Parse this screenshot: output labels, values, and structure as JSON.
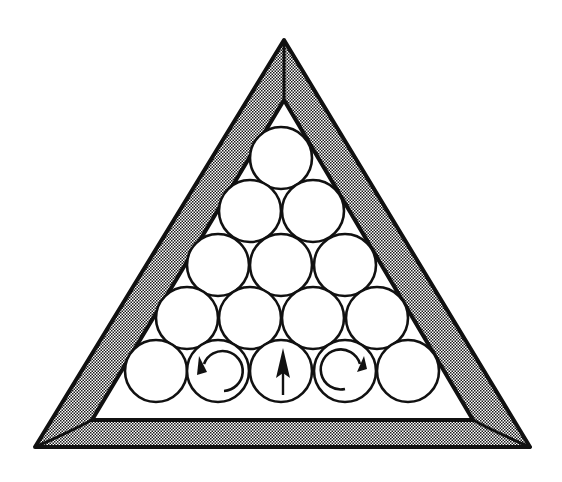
{
  "diagram": {
    "colors": {
      "background": "#ffffff",
      "stroke": "#111111",
      "frame_fill_light": "#ffffff",
      "frame_fill_dot": "#1a1a1a"
    },
    "frame": {
      "outer": [
        [
          284,
          40
        ],
        [
          35,
          447
        ],
        [
          530,
          447
        ]
      ],
      "inner": [
        [
          284,
          100
        ],
        [
          92,
          420
        ],
        [
          473,
          420
        ]
      ]
    },
    "ball_radius": 31,
    "rows": [
      {
        "y": 158,
        "x": [
          281
        ]
      },
      {
        "y": 211,
        "x": [
          250,
          313
        ]
      },
      {
        "y": 265,
        "x": [
          218,
          281,
          345
        ]
      },
      {
        "y": 318,
        "x": [
          187,
          250,
          313,
          377
        ]
      },
      {
        "y": 371,
        "x": [
          156,
          218,
          281,
          345,
          408
        ]
      }
    ],
    "annotations": [
      {
        "ball": "row5-2",
        "symbol": "counterclockwise-spin-arrow"
      },
      {
        "ball": "row5-3",
        "symbol": "straight-up-arrow"
      },
      {
        "ball": "row5-4",
        "symbol": "clockwise-spin-arrow"
      }
    ]
  }
}
